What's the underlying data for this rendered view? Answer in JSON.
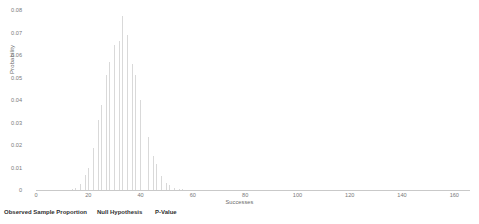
{
  "chart_data": {
    "type": "bar",
    "title": "",
    "subtitle": "",
    "xlabel": "Successes",
    "ylabel": "Probability",
    "xlim": [
      0,
      166
    ],
    "ylim": [
      0,
      0.08
    ],
    "xticks": [
      0,
      20,
      40,
      60,
      80,
      100,
      120,
      140,
      160
    ],
    "xticklabels": [
      "0",
      "20",
      "40",
      "60",
      "80",
      "100",
      "120",
      "140",
      "160"
    ],
    "yticks": [
      0,
      0.01,
      0.02,
      0.03,
      0.04,
      0.05,
      0.06,
      0.07,
      0.08
    ],
    "yticklabels": [
      "0",
      "0.01",
      "0.02",
      "0.03",
      "0.04",
      "0.05",
      "0.06",
      "0.07",
      "0.08"
    ],
    "grid": false,
    "legend": null,
    "bar_color": "#d9d9d9",
    "categories": [
      14,
      15,
      16,
      17,
      18,
      19,
      20,
      21,
      22,
      23,
      24,
      25,
      26,
      27,
      28,
      29,
      30,
      31,
      32,
      33,
      34,
      35,
      36,
      37,
      38,
      39,
      40,
      41,
      42,
      43,
      44,
      45,
      46,
      47,
      48,
      49,
      50,
      51,
      52,
      53,
      54,
      55,
      56
    ],
    "values": [
      0.0005,
      0.0009,
      0.0016,
      0.0027,
      0.0043,
      0.0066,
      0.0097,
      0.0136,
      0.0186,
      0.0244,
      0.0309,
      0.0378,
      0.0447,
      0.0512,
      0.0569,
      0.0614,
      0.0645,
      0.0661,
      0.0661,
      0.0775,
      0.0722,
      0.069,
      0.06,
      0.0561,
      0.051,
      0.0455,
      0.0398,
      0.0341,
      0.0286,
      0.0235,
      0.0189,
      0.0149,
      0.0115,
      0.0087,
      0.0064,
      0.0046,
      0.0033,
      0.0023,
      0.0015,
      0.001,
      0.0006,
      0.0004,
      0.0002
    ]
  },
  "footer": {
    "items": [
      {
        "label": "Observed Sample Proportion",
        "x": 4
      },
      {
        "label": "Null Hypothesis",
        "x": 97
      },
      {
        "label": "P-Value",
        "x": 155
      }
    ]
  }
}
